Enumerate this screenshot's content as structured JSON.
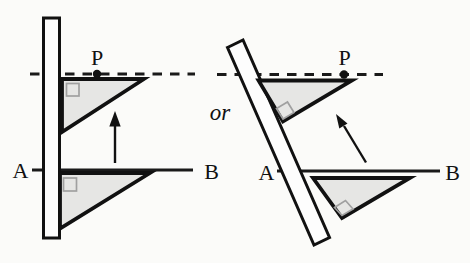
{
  "left_diagram": {
    "point_label": "P",
    "line_start_label": "A",
    "line_end_label": "B"
  },
  "right_diagram": {
    "point_label": "P",
    "line_start_label": "A",
    "line_end_label": "B"
  },
  "connector": {
    "or_label": "or"
  },
  "colors": {
    "ink": "#1a1a1a",
    "triangle_fill": "#e6e6e4",
    "ruler_fill": "#fdfdfd",
    "angle_mark": "#a0a0a0",
    "background": "#fbfbf9"
  }
}
